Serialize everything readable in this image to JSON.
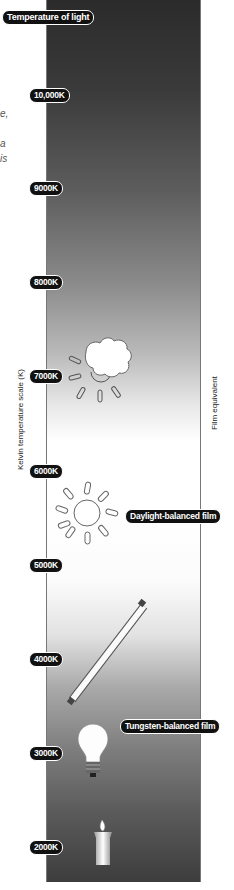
{
  "title": "Temperature of light",
  "axis_left_label": "Kelvin temperature scale (K)",
  "axis_right_label": "Film equivalent",
  "ticks": [
    {
      "label": "10,000K",
      "y": 88
    },
    {
      "label": "9000K",
      "y": 181
    },
    {
      "label": "8000K",
      "y": 275
    },
    {
      "label": "7000K",
      "y": 369
    },
    {
      "label": "6000K",
      "y": 464
    },
    {
      "label": "5000K",
      "y": 558
    },
    {
      "label": "4000K",
      "y": 652
    },
    {
      "label": "3000K",
      "y": 746
    },
    {
      "label": "2000K",
      "y": 840
    }
  ],
  "film_labels": {
    "daylight": "Daylight-balanced film",
    "tungsten": "Tungsten-balanced film"
  },
  "icons": [
    "cloud-sun-icon",
    "sun-icon",
    "fluorescent-tube-icon",
    "light-bulb-icon",
    "candle-icon"
  ],
  "left_fragments": [
    "e,",
    "a",
    "is"
  ],
  "colors": {
    "gradient_top": "#2b2b2b",
    "gradient_mid": "#ffffff",
    "gradient_bottom": "#3d3d3d",
    "pill_bg": "#111111"
  }
}
